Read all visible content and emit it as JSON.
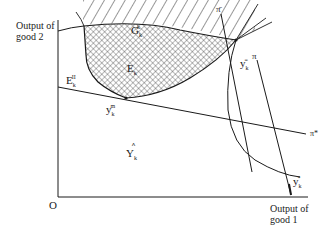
{
  "axes": {
    "y_label_line1": "Output of",
    "y_label_line2": "good 2",
    "x_label_line1": "Output of",
    "x_label_line2": "good 1",
    "origin": "O"
  },
  "regions": {
    "G": {
      "base": "G",
      "sup": "k",
      "sub": "k"
    },
    "E": {
      "base": "E",
      "sub": "k"
    },
    "E_II": {
      "base": "E",
      "sup": "II",
      "sub": "k"
    },
    "Y_hat": {
      "base": "Y",
      "hat": "^^",
      "sub": "k"
    }
  },
  "points": {
    "y_bar": {
      "base": "y",
      "sup": "=",
      "sub": "k"
    },
    "y_m": {
      "base": "y",
      "sup": "m",
      "sub": "k"
    },
    "y_star": {
      "base": "y",
      "sup": "*",
      "sub": "k"
    }
  },
  "lines": {
    "pi_bar": "π̄",
    "pi": "π",
    "pi_star": "π*"
  },
  "colors": {
    "ink": "#1a1a1a",
    "background": "#ffffff"
  }
}
